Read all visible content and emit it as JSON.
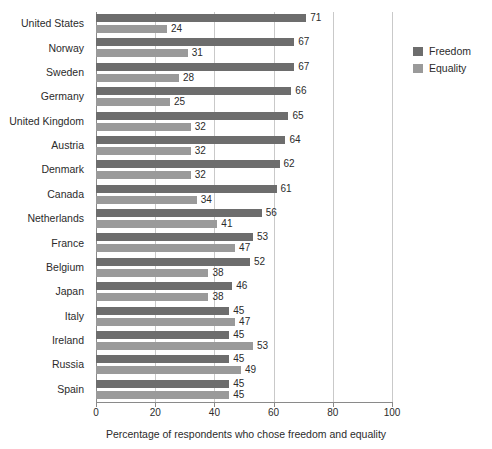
{
  "chart_data": {
    "type": "bar",
    "orientation": "horizontal",
    "title": "",
    "xlabel": "Percentage of respondents who chose freedom and equality",
    "ylabel": "",
    "xlim": [
      0,
      100
    ],
    "xticks": [
      0,
      20,
      40,
      60,
      80,
      100
    ],
    "grid": true,
    "legend_position": "right",
    "categories": [
      "United States",
      "Norway",
      "Sweden",
      "Germany",
      "United Kingdom",
      "Austria",
      "Denmark",
      "Canada",
      "Netherlands",
      "France",
      "Belgium",
      "Japan",
      "Italy",
      "Ireland",
      "Russia",
      "Spain"
    ],
    "series": [
      {
        "name": "Freedom",
        "color": "#6d6d6d",
        "values": [
          71,
          67,
          67,
          66,
          65,
          64,
          62,
          61,
          56,
          53,
          52,
          46,
          45,
          45,
          45,
          45
        ]
      },
      {
        "name": "Equality",
        "color": "#9a9a9a",
        "values": [
          24,
          31,
          28,
          25,
          32,
          32,
          32,
          34,
          41,
          47,
          38,
          38,
          47,
          53,
          49,
          45
        ]
      }
    ]
  },
  "legend": {
    "items": [
      {
        "label": "Freedom",
        "color": "#6d6d6d"
      },
      {
        "label": "Equality",
        "color": "#9a9a9a"
      }
    ]
  }
}
